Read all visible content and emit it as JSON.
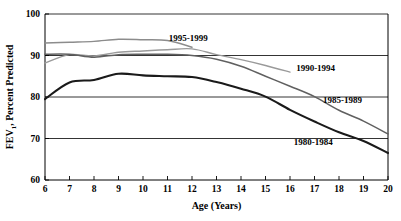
{
  "chart_data": {
    "type": "line",
    "title": "",
    "xlabel": "Age  (Years)",
    "ylabel": "FEV",
    "ylabel_sub": "1",
    "ylabel_rest": ", Percent Predicted",
    "xlim": [
      6,
      20
    ],
    "ylim": [
      60,
      100
    ],
    "xticks": [
      6,
      7,
      8,
      9,
      10,
      11,
      12,
      13,
      14,
      15,
      16,
      17,
      18,
      19,
      20
    ],
    "xtick_labels": [
      "6",
      "7",
      "8",
      "9",
      "10",
      "11",
      "12",
      "13",
      "14",
      "15",
      "16",
      "17",
      "18",
      "19",
      "20"
    ],
    "yticks": [
      60,
      70,
      80,
      90,
      100
    ],
    "ytick_labels": [
      "60",
      "70",
      "80",
      "90",
      "100"
    ],
    "grid": "horizontal",
    "gridlines": [
      70,
      80,
      90,
      100
    ],
    "legend_position": "inline-annotations",
    "series": [
      {
        "name": "1995-1999",
        "color": "#8c8c8c",
        "width": 1.4,
        "label_x": 11.05,
        "label_y": 93.6,
        "x": [
          6,
          7,
          8,
          9,
          10,
          11,
          12
        ],
        "values": [
          93.0,
          93.2,
          93.4,
          93.9,
          93.8,
          93.6,
          92.0
        ]
      },
      {
        "name": "1990-1994",
        "color": "#9a9a9a",
        "width": 1.4,
        "label_x": 16.25,
        "label_y": 86.2,
        "x": [
          6,
          7,
          8,
          9,
          10,
          11,
          12,
          13,
          14,
          15,
          16
        ],
        "values": [
          88.2,
          90.2,
          89.9,
          90.8,
          91.1,
          91.4,
          91.6,
          90.2,
          89.0,
          87.6,
          86.0
        ]
      },
      {
        "name": "1985-1989",
        "color": "#606060",
        "width": 1.5,
        "label_x": 17.35,
        "label_y": 78.5,
        "x": [
          6,
          7,
          8,
          9,
          10,
          11,
          12,
          13,
          14,
          15,
          16,
          17,
          18,
          19,
          20
        ],
        "values": [
          90.3,
          90.3,
          89.6,
          90.2,
          90.3,
          90.3,
          90.0,
          89.1,
          87.4,
          85.0,
          82.6,
          80.1,
          76.8,
          74.2,
          71.1
        ]
      },
      {
        "name": "1980-1984",
        "color": "#1a1a1a",
        "width": 2.1,
        "label_x": 16.15,
        "label_y": 68.4,
        "x": [
          6,
          7,
          8,
          9,
          10,
          11,
          12,
          13,
          14,
          15,
          16,
          17,
          18,
          19,
          20
        ],
        "values": [
          79.5,
          83.5,
          84.1,
          85.6,
          85.2,
          85.0,
          84.8,
          83.6,
          82.0,
          80.1,
          76.9,
          74.1,
          71.5,
          69.4,
          66.5
        ]
      }
    ]
  },
  "colors": {
    "axis": "#000000",
    "grid": "#000000",
    "background": "#ffffff"
  }
}
